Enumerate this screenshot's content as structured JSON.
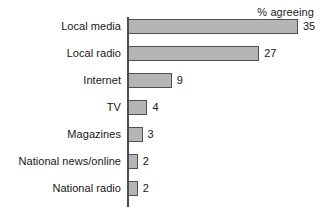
{
  "chart_data": {
    "type": "bar",
    "orientation": "horizontal",
    "title": "",
    "subtitle": "",
    "header_note": "% agreeing",
    "xlabel": "",
    "ylabel": "",
    "categories": [
      "Local media",
      "Local radio",
      "Internet",
      "TV",
      "Magazines",
      "National news/online",
      "National radio"
    ],
    "values": [
      35,
      27,
      9,
      4,
      3,
      2,
      2
    ],
    "value_labels": [
      "35",
      "27",
      "9",
      "4",
      "3",
      "2",
      "2"
    ],
    "xlim": [
      0,
      35
    ],
    "grid": false,
    "legend": "none",
    "bar_color": "#b5b5b5",
    "bar_border_color": "#4f4f4f",
    "axis_color": "#4d4d4d",
    "text_color": "#161616",
    "background_color": "#ffffff"
  }
}
